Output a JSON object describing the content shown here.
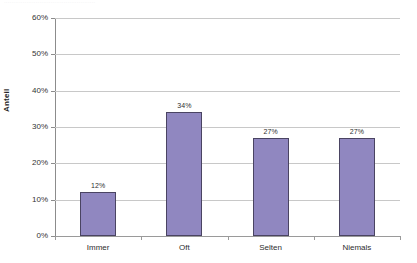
{
  "header_remnant": "·················································",
  "chart_data": {
    "type": "bar",
    "title": "",
    "xlabel": "",
    "ylabel": "Anteil",
    "categories": [
      "Immer",
      "Oft",
      "Selten",
      "Niemals"
    ],
    "values": [
      12,
      34,
      27,
      27
    ],
    "value_labels": [
      "12%",
      "34%",
      "27%",
      "27%"
    ],
    "ylim": [
      0,
      60
    ],
    "y_ticks": [
      0,
      10,
      20,
      30,
      40,
      50,
      60
    ],
    "y_tick_labels": [
      "0%",
      "10%",
      "20%",
      "30%",
      "40%",
      "50%",
      "60%"
    ],
    "grid": true,
    "legend": "none",
    "bar_color": "#9087c0",
    "bar_border_color": "#4a4462",
    "gridline_color": "#c8c8c8",
    "axis_color": "#8c8c8c",
    "background": "#ffffff"
  }
}
